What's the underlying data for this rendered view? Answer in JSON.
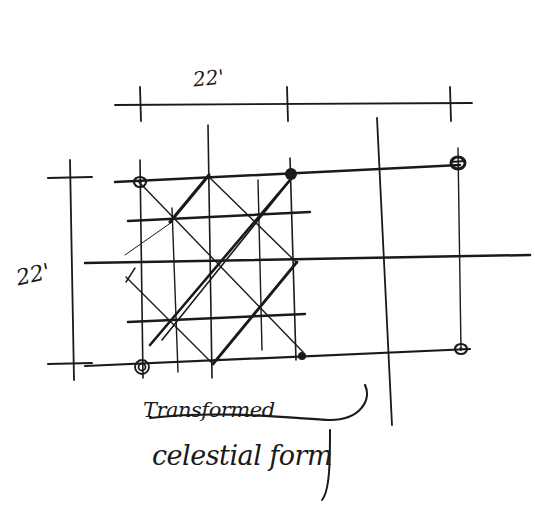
{
  "diagram": {
    "dimensions": {
      "top": "22'",
      "left": "22'"
    },
    "caption": {
      "line1": "Transformed",
      "line2": "celestial form"
    },
    "ink_color": "#1a1a1a",
    "dimension_lines": {
      "horizontal": {
        "x1": 115,
        "y1": 105,
        "x2": 472,
        "y2": 103,
        "ticks_x": [
          140,
          287,
          450
        ]
      },
      "vertical": {
        "x1": 70,
        "y1": 160,
        "x2": 74,
        "y2": 380,
        "ticks_y": [
          178,
          364
        ]
      }
    },
    "grid": {
      "horizontal_lines": [
        {
          "x1": 115,
          "y1": 182,
          "x2": 460,
          "y2": 165,
          "weight": 2.5
        },
        {
          "x1": 128,
          "y1": 221,
          "x2": 310,
          "y2": 212,
          "weight": 2.5
        },
        {
          "x1": 85,
          "y1": 263,
          "x2": 530,
          "y2": 255,
          "weight": 2.5
        },
        {
          "x1": 128,
          "y1": 322,
          "x2": 305,
          "y2": 314,
          "weight": 2.5
        },
        {
          "x1": 85,
          "y1": 366,
          "x2": 470,
          "y2": 349,
          "weight": 2.2
        }
      ],
      "vertical_lines": [
        {
          "x1": 140,
          "y1": 160,
          "x2": 143,
          "y2": 378,
          "weight": 1.6
        },
        {
          "x1": 172,
          "y1": 208,
          "x2": 178,
          "y2": 372,
          "weight": 1.4
        },
        {
          "x1": 208,
          "y1": 125,
          "x2": 212,
          "y2": 378,
          "weight": 1.6
        },
        {
          "x1": 258,
          "y1": 180,
          "x2": 262,
          "y2": 350,
          "weight": 1.4
        },
        {
          "x1": 290,
          "y1": 158,
          "x2": 296,
          "y2": 360,
          "weight": 1.6
        },
        {
          "x1": 377,
          "y1": 118,
          "x2": 392,
          "y2": 425,
          "weight": 1.8
        },
        {
          "x1": 458,
          "y1": 148,
          "x2": 461,
          "y2": 350,
          "weight": 1.4
        }
      ]
    },
    "diagonals": [
      {
        "x1": 140,
        "y1": 183,
        "x2": 303,
        "y2": 352,
        "weight": 1.4
      },
      {
        "x1": 126,
        "y1": 277,
        "x2": 213,
        "y2": 364,
        "weight": 1.4
      },
      {
        "x1": 208,
        "y1": 176,
        "x2": 296,
        "y2": 262,
        "weight": 1.4
      },
      {
        "x1": 170,
        "y1": 222,
        "x2": 209,
        "y2": 175,
        "weight": 3.2
      },
      {
        "x1": 150,
        "y1": 345,
        "x2": 290,
        "y2": 180,
        "weight": 2.6
      },
      {
        "x1": 162,
        "y1": 340,
        "x2": 292,
        "y2": 178,
        "weight": 1.6
      },
      {
        "x1": 213,
        "y1": 364,
        "x2": 297,
        "y2": 262,
        "weight": 2.8
      },
      {
        "x1": 125,
        "y1": 255,
        "x2": 172,
        "y2": 222,
        "weight": 1.0
      },
      {
        "x1": 126,
        "y1": 282,
        "x2": 135,
        "y2": 268,
        "weight": 1.4
      }
    ],
    "nodes": [
      {
        "name": "column-node-top-left",
        "cx": 140,
        "cy": 182,
        "type": "ring"
      },
      {
        "name": "column-node-top-mid",
        "cx": 291,
        "cy": 174,
        "type": "filled"
      },
      {
        "name": "column-node-top-right",
        "cx": 458,
        "cy": 163,
        "type": "ring-cross"
      },
      {
        "name": "column-node-bottom-left",
        "cx": 142,
        "cy": 367,
        "type": "double-ring"
      },
      {
        "name": "column-node-bottom-mid",
        "cx": 302,
        "cy": 356,
        "type": "small-filled"
      },
      {
        "name": "column-node-bottom-right",
        "cx": 461,
        "cy": 349,
        "type": "ring"
      }
    ],
    "caption_flourish": "M 150 418 C 220 410, 290 418, 330 420 C 360 420, 372 400, 365 385",
    "caption_descender": "M 330 430 C 330 460, 330 490, 322 500"
  }
}
